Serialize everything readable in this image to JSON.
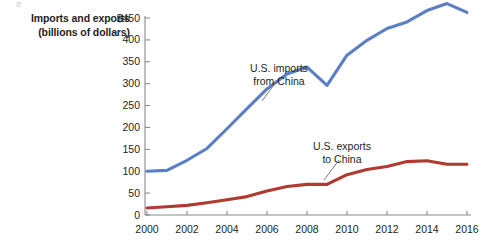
{
  "figure": {
    "artifact_glyph": "g"
  },
  "axis_title": {
    "line1": "Imports and exports",
    "line2": "(billions of dollars)"
  },
  "colors": {
    "imports_line": "#5B7FC4",
    "exports_line": "#B03A30",
    "axis": "#8a8a8a",
    "text": "#231f20",
    "background": "#ffffff"
  },
  "annotations": [
    {
      "name": "imports-annotation",
      "line1": "U.S. imports",
      "line2": "from China"
    },
    {
      "name": "exports-annotation",
      "line1": "U.S. exports",
      "line2": "to China"
    }
  ],
  "chart_data": {
    "type": "line",
    "title": "",
    "xlabel": "",
    "ylabel": "Imports and exports (billions of dollars)",
    "ylim": [
      0,
      450
    ],
    "xlim": [
      2000,
      2016
    ],
    "grid": false,
    "legend": "inline-annotations",
    "ytick_labels": [
      "$450",
      "400",
      "350",
      "300",
      "250",
      "200",
      "150",
      "100",
      "50",
      "0"
    ],
    "ytick_values": [
      450,
      400,
      350,
      300,
      250,
      200,
      150,
      100,
      50,
      0
    ],
    "xtick_labels": [
      "2000",
      "2002",
      "2004",
      "2006",
      "2008",
      "2010",
      "2012",
      "2014",
      "2016"
    ],
    "xtick_values": [
      2000,
      2002,
      2004,
      2006,
      2008,
      2010,
      2012,
      2014,
      2016
    ],
    "x": [
      2000,
      2001,
      2002,
      2003,
      2004,
      2005,
      2006,
      2007,
      2008,
      2009,
      2010,
      2011,
      2012,
      2013,
      2014,
      2015,
      2016
    ],
    "series": [
      {
        "name": "U.S. imports from China",
        "color": "#5B7FC4",
        "values": [
          100,
          102,
          125,
          152,
          197,
          243,
          288,
          322,
          338,
          296,
          365,
          399,
          426,
          441,
          467,
          483,
          463
        ]
      },
      {
        "name": "U.S. exports to China",
        "color": "#B03A30",
        "values": [
          16,
          19,
          22,
          28,
          35,
          42,
          55,
          65,
          70,
          70,
          92,
          104,
          111,
          122,
          124,
          116,
          116
        ]
      }
    ]
  }
}
